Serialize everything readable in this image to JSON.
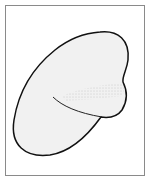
{
  "figure": {
    "frame_color": "#8a8a8a",
    "outline_color": "#111111",
    "fill_color": "#f1f1f1",
    "stipple_color": "#9a9a9a"
  }
}
